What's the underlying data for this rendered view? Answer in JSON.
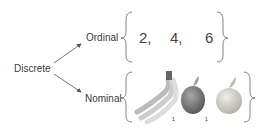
{
  "root": {
    "label": "Discrete"
  },
  "branches": [
    {
      "label": "Ordinal",
      "items": [
        "2,",
        "4,",
        "6"
      ]
    },
    {
      "label": "Nominal",
      "items": [
        "banana-icon",
        "apple-icon",
        "orange-icon"
      ],
      "marks": [
        "1",
        "1"
      ]
    }
  ],
  "colors": {
    "line": "#555555",
    "text": "#3a3a3a",
    "banana": "#e6e6d8",
    "apple": "#7a7a7a",
    "orange": "#c8c8c0"
  }
}
